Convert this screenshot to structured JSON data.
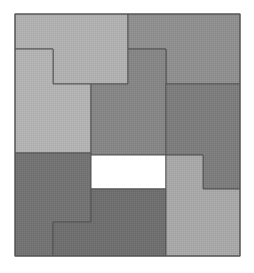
{
  "diagram": {
    "type": "polyomino-tiling-puzzle",
    "frame": {
      "x": 15,
      "y": 14,
      "width": 225,
      "height": 242,
      "stroke": "#555555"
    },
    "pieces": [
      {
        "id": "top-left-light",
        "fill": "#b1b1b1",
        "points": "15,14 128,14 128,84 53,84 53,49 15,49"
      },
      {
        "id": "top-right-medium",
        "fill": "#8f8f8f",
        "points": "128,14 240,14 240,84 166,84 166,49 128,49"
      },
      {
        "id": "left-light",
        "fill": "#b4b4b4",
        "points": "15,49 53,49 53,84 91,84 91,153 15,153"
      },
      {
        "id": "center-medium",
        "fill": "#868686",
        "points": "91,84 128,84 128,49 166,49 166,155 91,155"
      },
      {
        "id": "right-dark",
        "fill": "#7d7d7d",
        "points": "166,84 240,84 240,189 203,189 203,155 166,155"
      },
      {
        "id": "bottom-left-dark",
        "fill": "#737373",
        "points": "15,153 91,153 91,222 53,222 53,256 15,256"
      },
      {
        "id": "white-gap",
        "fill": "#ffffff",
        "points": "91,155 166,155 166,189 91,189"
      },
      {
        "id": "bottom-center-dark",
        "fill": "#6f6f6f",
        "points": "91,189 166,189 166,256 53,256 53,222 91,222"
      },
      {
        "id": "bottom-right-light",
        "fill": "#a9a9a9",
        "points": "166,155 203,155 203,189 240,189 240,256 166,256"
      }
    ]
  }
}
